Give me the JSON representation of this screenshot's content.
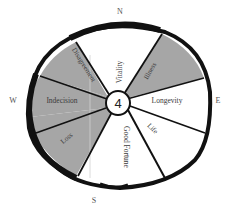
{
  "diagram": {
    "hub_label": "4",
    "compass": {
      "north": "N",
      "south": "S",
      "west": "W",
      "east": "E"
    },
    "sectors": [
      {
        "label": "Vitality",
        "shaded": false
      },
      {
        "label": "Illness",
        "shaded": true
      },
      {
        "label": "Longevity",
        "shaded": false
      },
      {
        "label": "Life",
        "shaded": false
      },
      {
        "label": "Good Fortune",
        "shaded": false
      },
      {
        "label": "Loss",
        "shaded": true
      },
      {
        "label": "Indecision",
        "shaded": true
      },
      {
        "label": "Disagreement",
        "shaded": true
      }
    ],
    "colors": {
      "shaded": "#a6a6a6",
      "unshaded": "#ffffff",
      "rim": "#111111"
    }
  }
}
